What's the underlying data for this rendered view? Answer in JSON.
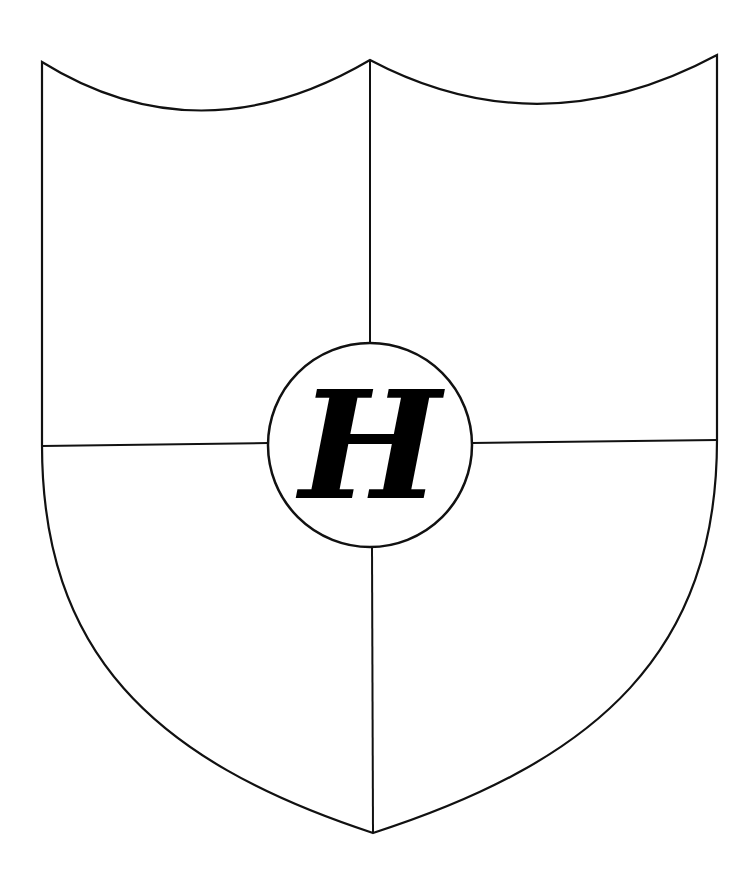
{
  "shield": {
    "stroke_color": "#111111",
    "fill_color": "#ffffff",
    "quarters": 4
  },
  "emblem": {
    "letter": "H",
    "style": "blackletter",
    "border_color": "#111111"
  }
}
